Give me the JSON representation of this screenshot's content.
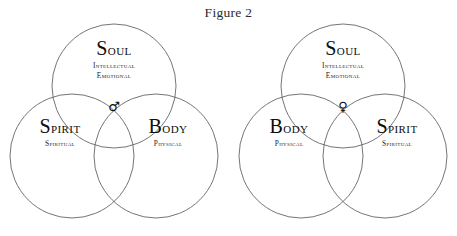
{
  "figure": {
    "title": "Figure 2",
    "background_color": "#ffffff",
    "stroke_color": "#5c5c5c",
    "text_color": "#0d0d0d"
  },
  "diagrams": [
    {
      "id": "left",
      "center_symbol": "♂",
      "center_symbol_name": "mars-male-symbol",
      "top": {
        "title": "Soul",
        "sub_line1": "Intellectual",
        "sub_line2": "Emotional"
      },
      "left": {
        "title": "Spirit",
        "sub_line1": "Spiritual"
      },
      "right": {
        "title": "Body",
        "sub_line1": "Physical"
      }
    },
    {
      "id": "right",
      "center_symbol": "♀",
      "center_symbol_name": "venus-female-symbol",
      "top": {
        "title": "Soul",
        "sub_line1": "Intellectual",
        "sub_line2": "Emotional"
      },
      "left": {
        "title": "Body",
        "sub_line1": "Physical"
      },
      "right": {
        "title": "Spirit",
        "sub_line1": "Spiritual"
      }
    }
  ]
}
